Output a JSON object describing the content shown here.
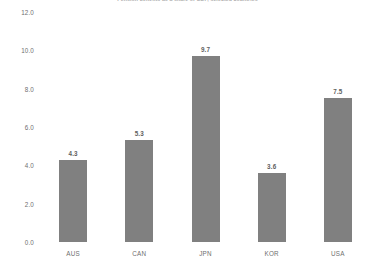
{
  "chart_data": {
    "type": "bar",
    "title": "Pension benefits as a share of GDP, selected countries",
    "subtitle": "",
    "xlabel": "",
    "ylabel": "",
    "categories": [
      "AUS",
      "CAN",
      "JPN",
      "KOR",
      "USA"
    ],
    "values": [
      4.3,
      5.3,
      9.7,
      3.6,
      7.5
    ],
    "value_labels": [
      "4.3",
      "5.3",
      "9.7",
      "3.6",
      "7.5"
    ],
    "ylim": [
      0.0,
      12.0
    ],
    "ytick_labels": [
      "12.0",
      "10.0",
      "8.0",
      "6.0",
      "4.0",
      "2.0",
      "0.0"
    ],
    "ytick_values": [
      12.0,
      10.0,
      8.0,
      6.0,
      4.0,
      2.0,
      0.0
    ],
    "grid": false,
    "legend": "none",
    "bar_color": "#808080",
    "background_color": "#ffffff",
    "text_color": "#6f6f6f"
  }
}
